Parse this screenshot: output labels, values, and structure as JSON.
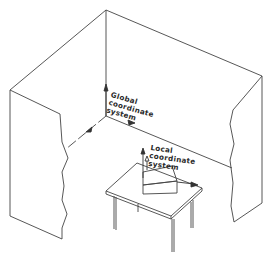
{
  "diagram": {
    "type": "isometric-room-illustration",
    "line_color": "#444444",
    "labels": {
      "global": [
        "Global",
        "coordinate",
        "system"
      ],
      "local": [
        "Local",
        "coordinate",
        "system"
      ]
    },
    "elements": [
      "room-walls",
      "global-axes",
      "table",
      "box-object",
      "local-axes"
    ]
  }
}
